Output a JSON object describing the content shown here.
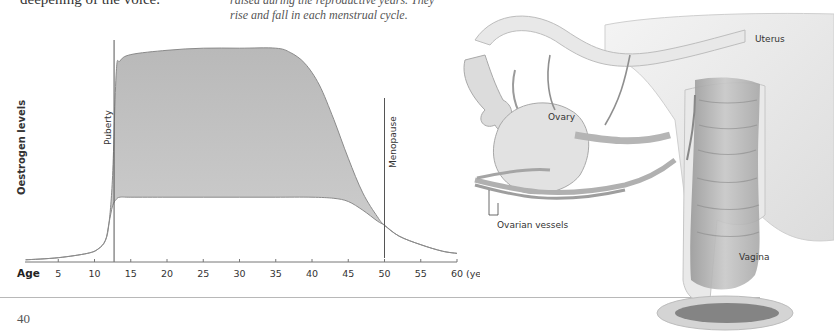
{
  "page": {
    "body_text_fragment": "deepening of the voice.",
    "caption_lines": [
      "raised during the reproductive years. They",
      "rise and fall in each menstrual cycle."
    ],
    "page_number": "40"
  },
  "chart_data": {
    "type": "area",
    "title": "",
    "xlabel": "Age",
    "xunit": "(years)",
    "ylabel": "Oestrogen levels",
    "xlim": [
      0,
      60
    ],
    "ylim": [
      0,
      100
    ],
    "xticks": [
      5,
      10,
      15,
      20,
      25,
      30,
      35,
      40,
      45,
      50,
      55,
      60
    ],
    "xtick_labels": [
      "5",
      "10",
      "15",
      "20",
      "25",
      "30",
      "35",
      "40",
      "45",
      "50",
      "55",
      "60"
    ],
    "grid": false,
    "series": [
      {
        "name": "Oestrogen upper range (cycle peak)",
        "x": [
          0.5,
          5,
          9,
          10.5,
          11.5,
          12,
          12.5,
          13,
          13.5,
          15,
          20,
          25,
          30,
          35,
          37,
          39,
          41,
          43,
          45,
          47,
          49,
          50,
          52,
          55,
          58,
          60
        ],
        "values": [
          1,
          2,
          4,
          6,
          10,
          18,
          40,
          88,
          93,
          96,
          98,
          99,
          99,
          99,
          97,
          92,
          82,
          66,
          48,
          32,
          21,
          17,
          12,
          8,
          5,
          4
        ]
      },
      {
        "name": "Oestrogen lower range (cycle trough)",
        "x": [
          0.5,
          5,
          9,
          10.5,
          11.5,
          12,
          12.5,
          13,
          13.5,
          15,
          20,
          25,
          30,
          35,
          40,
          43,
          45,
          47,
          49,
          50,
          52,
          55,
          58,
          60
        ],
        "values": [
          1,
          2,
          4,
          6,
          10,
          18,
          26,
          29,
          30,
          30,
          30,
          30,
          30,
          30,
          30,
          29.5,
          28,
          24,
          19,
          17,
          12,
          8,
          5,
          4
        ]
      }
    ],
    "annotations": [
      {
        "label": "Puberty",
        "x": 12.7,
        "type": "vertical-line"
      },
      {
        "label": "Menopause",
        "x": 50,
        "type": "vertical-line"
      }
    ],
    "colors": {
      "fill": "#c4c4c4",
      "fill_dark": "#b2b2b2",
      "outline": "#8a8a8a",
      "axis": "#777777",
      "marker_line": "#555555"
    }
  },
  "illustration": {
    "labels": {
      "uterus": "Uterus",
      "ovary": "Ovary",
      "ovarian_vessels": "Ovarian vessels",
      "vagina": "Vagina"
    }
  }
}
